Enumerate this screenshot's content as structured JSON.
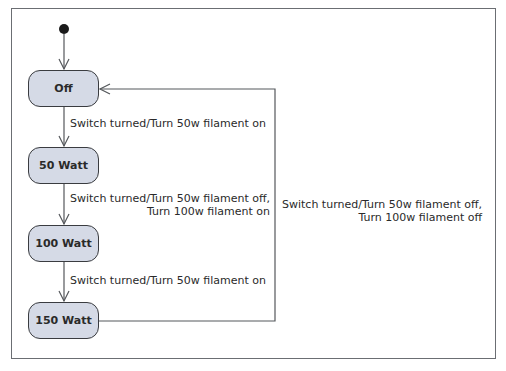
{
  "diagram": {
    "type": "UML state machine",
    "initial_state": "Off",
    "states": [
      {
        "id": "off",
        "label": "Off"
      },
      {
        "id": "w50",
        "label": "50 Watt"
      },
      {
        "id": "w100",
        "label": "100 Watt"
      },
      {
        "id": "w150",
        "label": "150 Watt"
      }
    ],
    "transitions": [
      {
        "from": "off",
        "to": "w50",
        "line1": "Switch turned/Turn 50w filament on",
        "line2": ""
      },
      {
        "from": "w50",
        "to": "w100",
        "line1": "Switch turned/Turn 50w filament off,",
        "line2": "Turn 100w filament on"
      },
      {
        "from": "w100",
        "to": "w150",
        "line1": "Switch turned/Turn 50w filament on",
        "line2": ""
      },
      {
        "from": "w150",
        "to": "off",
        "line1": "Switch turned/Turn 50w filament off,",
        "line2": "Turn 100w filament off"
      }
    ],
    "colors": {
      "state_fill": "#d5dae6",
      "state_border": "#3a3c40",
      "line": "#55585c",
      "frame": "#6b6e73"
    }
  }
}
